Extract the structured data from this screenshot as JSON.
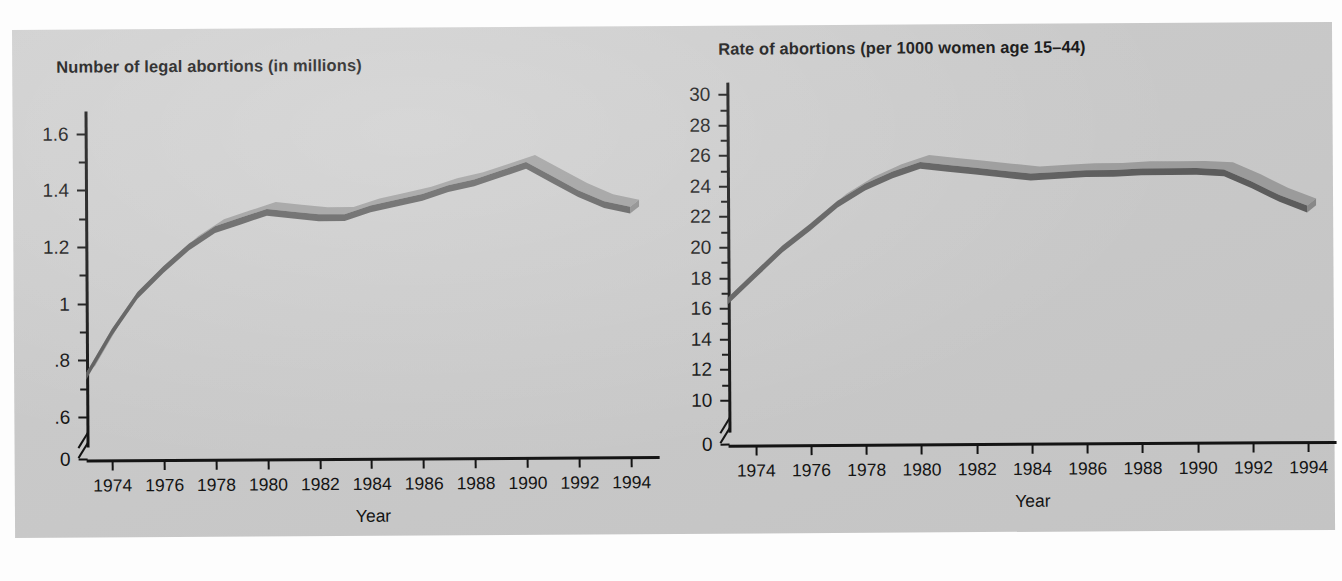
{
  "figure": {
    "background_color": "#c9c9c9",
    "page_color": "#fdfdfd",
    "caption_fragment": ""
  },
  "chart_data": [
    {
      "id": "legal-abortions-count",
      "type": "line",
      "title": "Number of legal abortions (in millions)",
      "xlabel": "Year",
      "ylabel": "",
      "x": [
        1973,
        1974,
        1975,
        1976,
        1977,
        1978,
        1979,
        1980,
        1981,
        1982,
        1983,
        1984,
        1985,
        1986,
        1987,
        1988,
        1989,
        1990,
        1991,
        1992,
        1993,
        1994
      ],
      "values": [
        0.745,
        0.9,
        1.03,
        1.12,
        1.2,
        1.26,
        1.29,
        1.32,
        1.31,
        1.3,
        1.3,
        1.33,
        1.35,
        1.37,
        1.4,
        1.42,
        1.45,
        1.48,
        1.43,
        1.38,
        1.34,
        1.32
      ],
      "tick_years": [
        1974,
        1976,
        1978,
        1980,
        1982,
        1984,
        1986,
        1988,
        1990,
        1992,
        1994
      ],
      "ytick_labels": [
        "1.6",
        "1.4",
        "1.2",
        "1",
        ".8",
        ".6",
        "0"
      ],
      "ytick_values": [
        1.6,
        1.4,
        1.2,
        1.0,
        0.8,
        0.6,
        0
      ],
      "yminor_values": [
        1.5,
        1.3,
        1.1,
        0.9,
        0.7
      ],
      "ylim": [
        0.55,
        1.68
      ],
      "axis_break": true,
      "grid": false,
      "legend": "none",
      "series_color_front": "#5c5c5c",
      "series_color_top": "#9b9b9b"
    },
    {
      "id": "abortion-rate",
      "type": "line",
      "title": "Rate of abortions (per 1000 women age 15–44)",
      "xlabel": "Year",
      "ylabel": "",
      "x": [
        1973,
        1974,
        1975,
        1976,
        1977,
        1978,
        1979,
        1980,
        1981,
        1982,
        1983,
        1984,
        1985,
        1986,
        1987,
        1988,
        1989,
        1990,
        1991,
        1992,
        1993,
        1994
      ],
      "values": [
        16.5,
        18.2,
        19.9,
        21.3,
        22.8,
        23.9,
        24.7,
        25.3,
        25.1,
        24.9,
        24.7,
        24.5,
        24.6,
        24.7,
        24.7,
        24.8,
        24.8,
        24.8,
        24.7,
        23.9,
        23.0,
        22.3
      ],
      "tick_years": [
        1974,
        1976,
        1978,
        1980,
        1982,
        1984,
        1986,
        1988,
        1990,
        1992,
        1994
      ],
      "ytick_labels": [
        "30",
        "28",
        "26",
        "24",
        "22",
        "20",
        "18",
        "16",
        "14",
        "12",
        "10",
        "0"
      ],
      "ytick_values": [
        30,
        28,
        26,
        24,
        22,
        20,
        18,
        16,
        14,
        12,
        10,
        0
      ],
      "yminor_values": [
        29,
        27,
        25,
        23,
        21,
        19,
        17,
        15,
        13,
        11
      ],
      "ylim": [
        9.2,
        30.8
      ],
      "axis_break": true,
      "grid": false,
      "legend": "none",
      "series_color_front": "#5c5c5c",
      "series_color_top": "#9b9b9b"
    }
  ]
}
